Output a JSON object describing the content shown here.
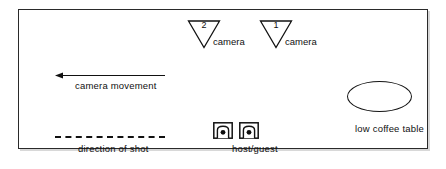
{
  "diagram": {
    "frame": {
      "stroke": "#2a2a2a",
      "fill": "#ffffff",
      "shadow": "#d8d8d8"
    },
    "cameras": [
      {
        "number": "2",
        "label": "camera",
        "icon": "camera-triangle-icon"
      },
      {
        "number": "1",
        "label": "camera",
        "icon": "camera-triangle-icon"
      }
    ],
    "annotations": [
      {
        "name": "camera-movement",
        "label": "camera movement",
        "marker": "left-arrow-icon"
      },
      {
        "name": "direction-of-shot",
        "label": "direction of shot",
        "marker": "dashed-line-icon"
      }
    ],
    "furniture": [
      {
        "name": "host-guest-seats",
        "label": "host/guest",
        "icon": "armchair-top-view-icon",
        "count": 2
      },
      {
        "name": "coffee-table",
        "label": "low coffee table",
        "icon": "ellipse-icon"
      }
    ],
    "ink": "#101010"
  }
}
